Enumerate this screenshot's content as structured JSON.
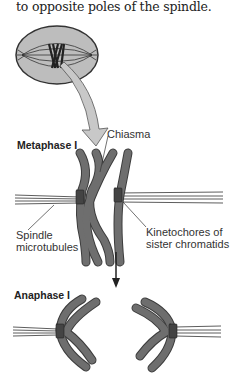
{
  "caption": {
    "text": "to opposite poles of the spindle."
  },
  "diagram": {
    "cell_overview": {
      "description": "Cell with spindle and paired homologous chromosomes at equator",
      "fill_color": "#bdbdbd",
      "outline_color": "#333333"
    },
    "stages": [
      {
        "label": "Metaphase I"
      },
      {
        "label": "Anaphase I"
      }
    ],
    "annotations": {
      "chiasma": "Chiasma",
      "spindle_line1": "Spindle",
      "spindle_line2": "microtubules",
      "kinetochore_line1": "Kinetochores of",
      "kinetochore_line2": "sister chromatids"
    },
    "colors": {
      "chromosome": "#6e6e6e",
      "chromosome_outline": "#3c3c3c",
      "kinetochore": "#444444",
      "arrow_fill": "#c8c8c8",
      "arrow_down": "#222222"
    }
  }
}
